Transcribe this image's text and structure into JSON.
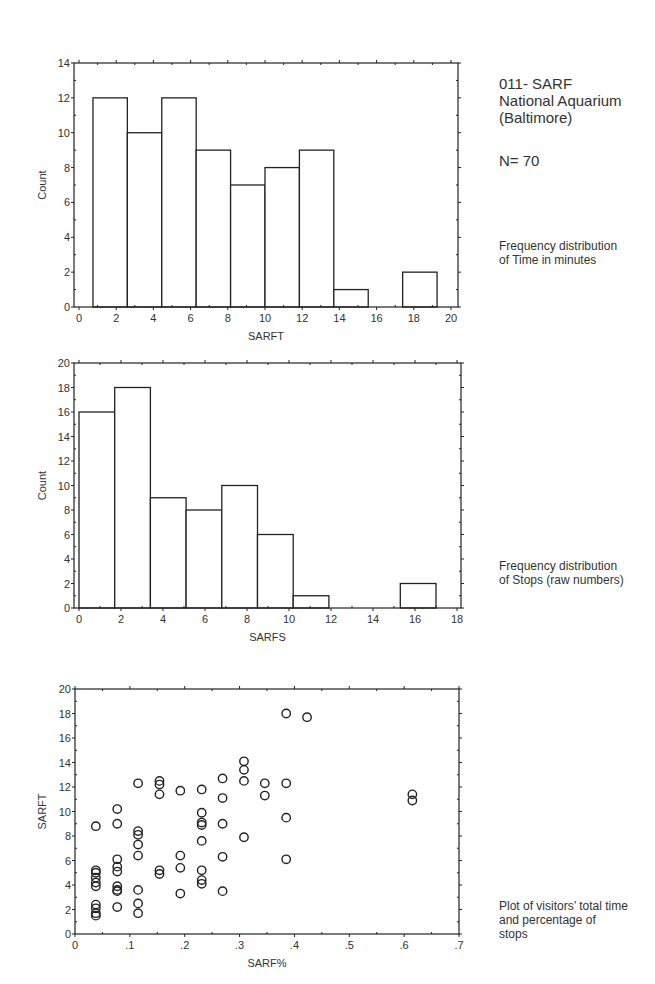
{
  "sidebar": {
    "title_lines": [
      "011- SARF",
      "National Aquarium",
      "(Baltimore)"
    ],
    "n_label": "N= 70",
    "caption_time": [
      "Frequency distribution",
      "of Time in minutes"
    ],
    "caption_stops": [
      "Frequency distribution",
      "of Stops (raw numbers)"
    ],
    "caption_scatter": [
      "Plot of visitors’ total time",
      "and percentage of",
      "stops"
    ]
  },
  "chart_data": [
    {
      "type": "bar",
      "subtype": "histogram",
      "title": "Frequency distribution of Time in minutes",
      "xlabel": "SARFT",
      "ylabel": "Count",
      "xlim": [
        0,
        20
      ],
      "ylim": [
        0,
        14
      ],
      "xticks": [
        0,
        2,
        4,
        6,
        8,
        10,
        12,
        14,
        16,
        18,
        20
      ],
      "yticks": [
        0,
        2,
        4,
        6,
        8,
        10,
        12,
        14
      ],
      "bin_edges": [
        0.75,
        2.6,
        4.45,
        6.3,
        8.15,
        10.0,
        11.85,
        13.7,
        15.55,
        17.4,
        19.25
      ],
      "values": [
        12,
        10,
        12,
        9,
        7,
        8,
        9,
        1,
        0,
        2
      ],
      "grid": false,
      "frame": {
        "left": 74,
        "right": 458,
        "top": 63,
        "bottom": 307,
        "x0px": 79,
        "x1px": 451
      }
    },
    {
      "type": "bar",
      "subtype": "histogram",
      "title": "Frequency distribution of Stops (raw numbers)",
      "xlabel": "SARFS",
      "ylabel": "Count",
      "xlim": [
        0,
        18
      ],
      "ylim": [
        0,
        20
      ],
      "xticks": [
        0,
        2,
        4,
        6,
        8,
        10,
        12,
        14,
        16,
        18
      ],
      "yticks": [
        0,
        2,
        4,
        6,
        8,
        10,
        12,
        14,
        16,
        18,
        20
      ],
      "bin_edges": [
        0,
        1.7,
        3.4,
        5.1,
        6.8,
        8.5,
        10.2,
        11.9,
        13.6,
        15.3,
        17.0
      ],
      "values": [
        16,
        18,
        9,
        8,
        10,
        6,
        1,
        0,
        0,
        2
      ],
      "grid": false,
      "frame": {
        "left": 74,
        "right": 461,
        "top": 363,
        "bottom": 608,
        "x0px": 79,
        "x1px": 457
      }
    },
    {
      "type": "scatter",
      "title": "Plot of visitors’ total time and percentage of stops",
      "xlabel": "SARF%",
      "ylabel": "SARFT",
      "xlim": [
        0,
        0.7
      ],
      "ylim": [
        0,
        20
      ],
      "xticks": [
        0,
        0.1,
        0.2,
        0.3,
        0.4,
        0.5,
        0.6,
        0.7
      ],
      "xtick_labels": [
        "0",
        ".1",
        ".2",
        ".3",
        ".4",
        ".5",
        ".6",
        ".7"
      ],
      "yticks": [
        0,
        2,
        4,
        6,
        8,
        10,
        12,
        14,
        16,
        18,
        20
      ],
      "grid": false,
      "marker": "open-circle",
      "frame": {
        "left": 75,
        "right": 459,
        "top": 689,
        "bottom": 934,
        "x0px": 75,
        "x1px": 459
      },
      "points": [
        [
          0.038,
          8.8
        ],
        [
          0.038,
          5.2
        ],
        [
          0.038,
          5.0
        ],
        [
          0.038,
          4.6
        ],
        [
          0.038,
          4.2
        ],
        [
          0.038,
          3.9
        ],
        [
          0.038,
          2.4
        ],
        [
          0.038,
          2.1
        ],
        [
          0.038,
          1.7
        ],
        [
          0.038,
          1.5
        ],
        [
          0.077,
          10.2
        ],
        [
          0.077,
          9.0
        ],
        [
          0.077,
          6.1
        ],
        [
          0.077,
          5.5
        ],
        [
          0.077,
          5.1
        ],
        [
          0.077,
          3.9
        ],
        [
          0.077,
          3.6
        ],
        [
          0.077,
          3.5
        ],
        [
          0.077,
          2.2
        ],
        [
          0.115,
          12.3
        ],
        [
          0.115,
          8.4
        ],
        [
          0.115,
          8.1
        ],
        [
          0.115,
          7.3
        ],
        [
          0.115,
          6.4
        ],
        [
          0.115,
          3.6
        ],
        [
          0.115,
          2.5
        ],
        [
          0.115,
          1.7
        ],
        [
          0.154,
          12.5
        ],
        [
          0.154,
          12.2
        ],
        [
          0.154,
          11.4
        ],
        [
          0.154,
          5.2
        ],
        [
          0.154,
          4.9
        ],
        [
          0.192,
          11.7
        ],
        [
          0.192,
          6.4
        ],
        [
          0.192,
          5.4
        ],
        [
          0.192,
          3.3
        ],
        [
          0.231,
          11.8
        ],
        [
          0.231,
          9.9
        ],
        [
          0.231,
          9.1
        ],
        [
          0.231,
          8.9
        ],
        [
          0.231,
          7.6
        ],
        [
          0.231,
          5.2
        ],
        [
          0.231,
          4.4
        ],
        [
          0.231,
          4.1
        ],
        [
          0.269,
          12.7
        ],
        [
          0.269,
          11.1
        ],
        [
          0.269,
          9.0
        ],
        [
          0.269,
          6.3
        ],
        [
          0.269,
          3.5
        ],
        [
          0.308,
          14.1
        ],
        [
          0.308,
          13.4
        ],
        [
          0.308,
          12.5
        ],
        [
          0.308,
          7.9
        ],
        [
          0.346,
          12.3
        ],
        [
          0.346,
          11.3
        ],
        [
          0.385,
          18.0
        ],
        [
          0.385,
          12.3
        ],
        [
          0.385,
          9.5
        ],
        [
          0.385,
          6.1
        ],
        [
          0.423,
          17.7
        ],
        [
          0.615,
          11.4
        ],
        [
          0.615,
          10.9
        ]
      ]
    }
  ]
}
